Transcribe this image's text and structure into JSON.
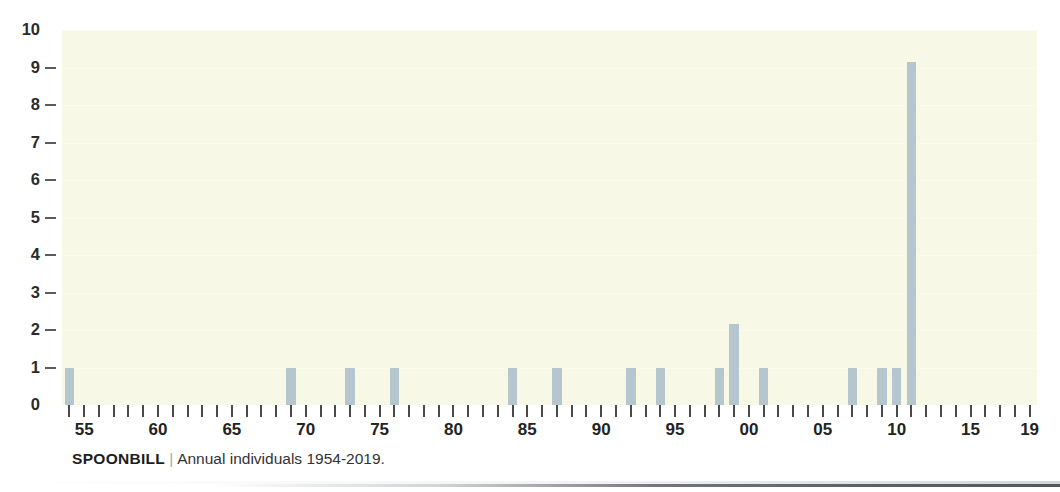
{
  "caption": {
    "species": "SPOONBILL",
    "separator": "|",
    "description": "Annual individuals 1954-2019."
  },
  "colors": {
    "bar": "#b6c6ce",
    "plot_background": "#f8f8e6",
    "page_background": "#ffffff",
    "axis_text": "#232323"
  },
  "chart_data": {
    "type": "bar",
    "title": "",
    "subtitle": "",
    "xlabel": "",
    "ylabel": "",
    "xlim": [
      1953.5,
      2019.5
    ],
    "ylim": [
      0,
      10
    ],
    "grid": true,
    "legend": null,
    "y_ticks": [
      0,
      1,
      2,
      3,
      4,
      5,
      6,
      7,
      8,
      9,
      10
    ],
    "y_tick_labels": [
      "0",
      "1",
      "2",
      "3",
      "4",
      "5",
      "6",
      "7",
      "8",
      "9",
      "10"
    ],
    "x_tick_labels": [
      "55",
      "60",
      "65",
      "70",
      "75",
      "80",
      "85",
      "90",
      "95",
      "00",
      "05",
      "10",
      "15",
      "19"
    ],
    "x_labeled_years": [
      1955,
      1960,
      1965,
      1970,
      1975,
      1980,
      1985,
      1990,
      1995,
      2000,
      2005,
      2010,
      2015,
      2019
    ],
    "x_minor_years_range": [
      1954,
      2019
    ],
    "categories": [
      1954,
      1955,
      1956,
      1957,
      1958,
      1959,
      1960,
      1961,
      1962,
      1963,
      1964,
      1965,
      1966,
      1967,
      1968,
      1969,
      1970,
      1971,
      1972,
      1973,
      1974,
      1975,
      1976,
      1977,
      1978,
      1979,
      1980,
      1981,
      1982,
      1983,
      1984,
      1985,
      1986,
      1987,
      1988,
      1989,
      1990,
      1991,
      1992,
      1993,
      1994,
      1995,
      1996,
      1997,
      1998,
      1999,
      2000,
      2001,
      2002,
      2003,
      2004,
      2005,
      2006,
      2007,
      2008,
      2009,
      2010,
      2011,
      2012,
      2013,
      2014,
      2015,
      2016,
      2017,
      2018,
      2019
    ],
    "values": [
      1,
      0,
      0,
      0,
      0,
      0,
      0,
      0,
      0,
      0,
      0,
      0,
      0,
      0,
      0,
      1,
      0,
      0,
      0,
      1,
      0,
      0,
      1,
      0,
      0,
      0,
      0,
      0,
      0,
      0,
      1,
      0,
      0,
      1,
      0,
      0,
      0,
      0,
      1,
      0,
      1,
      0,
      0,
      0,
      1,
      2.15,
      0,
      1,
      0,
      0,
      0,
      0,
      0,
      1,
      0,
      1,
      1,
      9.15,
      0,
      0,
      0,
      0,
      0,
      0,
      0,
      0
    ]
  }
}
